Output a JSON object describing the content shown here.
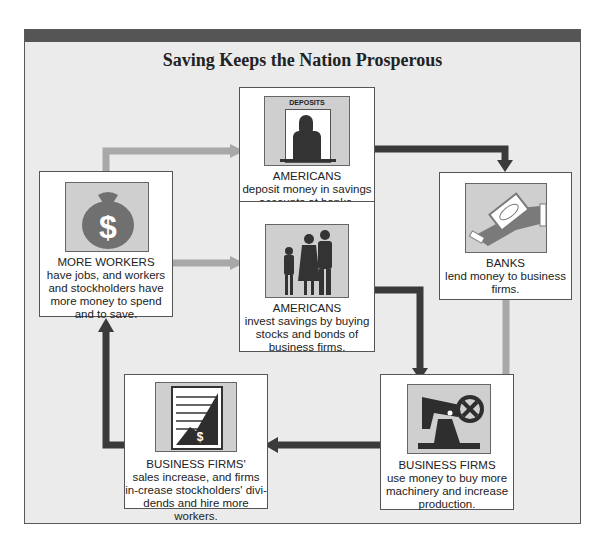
{
  "title": "Saving Keeps the Nation Prosperous",
  "colors": {
    "dark_arrow": "#3a3a3a",
    "light_arrow": "#a8a8a8",
    "frame_bg": "#ebebeb",
    "top_bar": "#555555"
  },
  "boxes": {
    "deposit": {
      "heading": "AMERICANS",
      "body": "deposit money in savings accounts at banks.",
      "sign": "DEPOSITS",
      "icon": "teller-icon"
    },
    "invest": {
      "heading": "AMERICANS",
      "body": "invest savings by buying stocks and bonds of business firms.",
      "icon": "family-icon"
    },
    "workers": {
      "heading": "MORE WORKERS",
      "body": "have jobs, and workers and stockholders have more money to spend and to save.",
      "icon": "money-bag-icon"
    },
    "banks": {
      "heading": "BANKS",
      "body": "lend money to business firms.",
      "icon": "hand-money-icon"
    },
    "firms_use": {
      "heading": "BUSINESS FIRMS",
      "body": "use money to buy more machinery and increase production.",
      "icon": "machinery-icon"
    },
    "firms_sales": {
      "heading": "BUSINESS FIRMS'",
      "body": "sales increase, and firms in-crease stockholders' divi-dends and hire more workers.",
      "icon": "sales-chart-icon"
    }
  }
}
